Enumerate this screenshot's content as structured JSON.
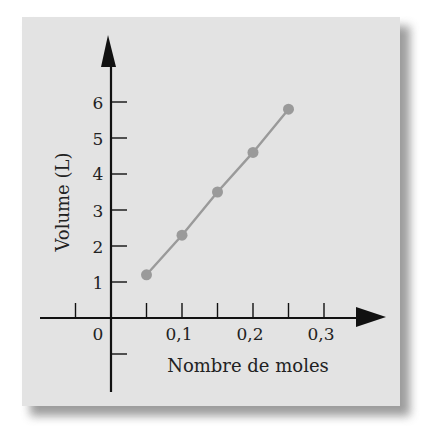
{
  "chart_data": {
    "type": "line",
    "title": "",
    "xlabel": "Nombre de moles",
    "ylabel": "Volume (L)",
    "x": [
      0.05,
      0.1,
      0.15,
      0.2,
      0.25
    ],
    "series": [
      {
        "name": "Volume",
        "values": [
          1.2,
          2.3,
          3.5,
          4.6,
          5.8
        ]
      }
    ],
    "x_ticks": [
      "0",
      "0,1",
      "0,2",
      "0,3"
    ],
    "x_minor_ticks": [
      -0.05,
      0.05,
      0.1,
      0.15,
      0.2,
      0.25,
      0.3
    ],
    "y_ticks": [
      "1",
      "2",
      "3",
      "4",
      "5",
      "6"
    ],
    "xlim": [
      -0.1,
      0.35
    ],
    "ylim": [
      -2,
      7
    ],
    "grid": false,
    "legend": null,
    "colors": {
      "panel": "#e3e3e3",
      "axis": "#111111",
      "series": "#9a9a9a",
      "text": "#222222"
    }
  }
}
